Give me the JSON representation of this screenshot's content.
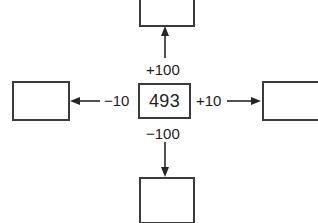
{
  "diagram": {
    "center": {
      "value": "493",
      "name": "center-number-box"
    },
    "answer_boxes": [
      {
        "position": "top",
        "value": ""
      },
      {
        "position": "right",
        "value": ""
      },
      {
        "position": "bottom",
        "value": ""
      },
      {
        "position": "left",
        "value": ""
      }
    ],
    "operations": {
      "up": "+100",
      "down": "−100",
      "left": "−10",
      "right": "+10"
    },
    "colors": {
      "box_border": "#3b3b3b",
      "arrow": "#262626",
      "text": "#1d1d1d",
      "background": "#ffffff"
    },
    "icons": {
      "arrow_up": "arrow-up-icon",
      "arrow_down": "arrow-down-icon",
      "arrow_left": "arrow-left-icon",
      "arrow_right": "arrow-right-icon"
    }
  }
}
